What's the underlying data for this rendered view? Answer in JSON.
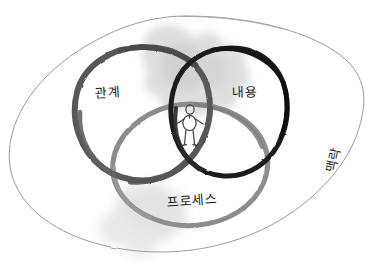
{
  "diagram": {
    "type": "venn-three-circle-with-context-boundary",
    "background_color": "#ffffff",
    "style": "hand-drawn brush sketch",
    "outer_boundary": {
      "name": "context-ellipse",
      "label": "맥락",
      "label_meaning": "context",
      "stroke_color": "#9a9a9a",
      "stroke_width": 1
    },
    "circles": [
      {
        "id": "relationship",
        "label": "관계",
        "label_meaning": "relationship",
        "position": "left",
        "stroke_color": "#595959",
        "stroke_width": 6
      },
      {
        "id": "content",
        "label": "내용",
        "label_meaning": "content",
        "position": "right",
        "stroke_color": "#1f1f1f",
        "stroke_width": 5
      },
      {
        "id": "process",
        "label": "프로세스",
        "label_meaning": "process",
        "position": "bottom",
        "stroke_color": "#8d8d8d",
        "stroke_width": 5
      }
    ],
    "center_figure": {
      "name": "stick-figure-person",
      "description": "person standing at the intersection of all three circles",
      "stroke_color": "#4a4a4a"
    },
    "smudges": [
      {
        "name": "smudge-top",
        "color": "#d5d5d5"
      },
      {
        "name": "smudge-bottom-left",
        "color": "#d8d8d8"
      }
    ]
  }
}
